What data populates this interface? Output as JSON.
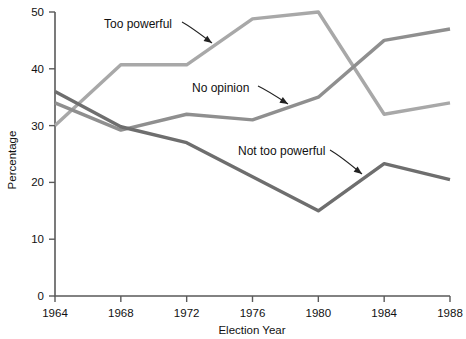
{
  "chart_data": {
    "type": "line",
    "title": "",
    "xlabel": "Election Year",
    "ylabel": "Percentage",
    "categories": [
      1964,
      1968,
      1972,
      1976,
      1980,
      1984,
      1988
    ],
    "x_tick_labels": [
      "1964",
      "1968",
      "1972",
      "1976",
      "1980",
      "1984",
      "1988"
    ],
    "y_tick_labels": [
      "0",
      "10",
      "20",
      "30",
      "40",
      "50"
    ],
    "y_ticks": [
      0,
      10,
      20,
      30,
      40,
      50
    ],
    "xlim": [
      1964,
      1988
    ],
    "ylim": [
      0,
      50
    ],
    "grid": false,
    "legend": "inline-annotations",
    "series": [
      {
        "name": "Too powerful",
        "color": "#a8a8a8",
        "values": [
          30,
          40.7,
          40.7,
          48.8,
          50,
          32,
          34
        ]
      },
      {
        "name": "No opinion",
        "color": "#8f8f8f",
        "values": [
          34,
          29.2,
          32,
          31,
          35,
          45,
          47
        ]
      },
      {
        "name": "Not too powerful",
        "color": "#6e6e6e",
        "values": [
          36,
          29.8,
          27,
          21,
          15,
          23.3,
          20.5
        ]
      }
    ],
    "annotations": [
      {
        "name": "too-powerful",
        "text": "Too powerful",
        "text_x": 104,
        "text_y": 28,
        "arrow_from_x": 182,
        "arrow_from_y": 22,
        "arrow_to_x": 212,
        "arrow_to_y": 43
      },
      {
        "name": "no-opinion",
        "text": "No opinion",
        "text_x": 192,
        "text_y": 92,
        "arrow_from_x": 258,
        "arrow_from_y": 86,
        "arrow_to_x": 288,
        "arrow_to_y": 104
      },
      {
        "name": "not-too-powerful",
        "text": "Not too powerful",
        "text_x": 238,
        "text_y": 155,
        "arrow_from_x": 330,
        "arrow_from_y": 150,
        "arrow_to_x": 362,
        "arrow_to_y": 174
      }
    ]
  },
  "colors": {
    "axis": "#5a5a5a",
    "text": "#111111",
    "background": "#ffffff",
    "too_powerful": "#a8a8a8",
    "no_opinion": "#8f8f8f",
    "not_too_powerful": "#6e6e6e"
  }
}
